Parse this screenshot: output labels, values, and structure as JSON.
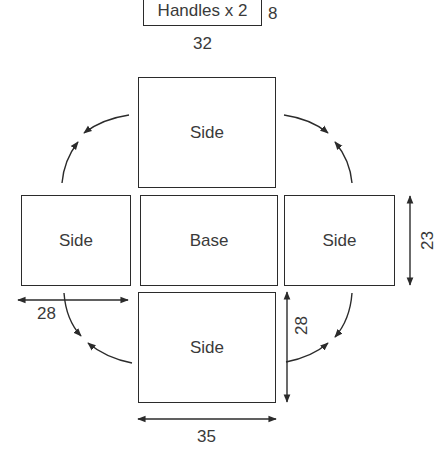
{
  "diagram": {
    "type": "box-net-template",
    "handles": {
      "label": "Handles x 2",
      "height_label": "8",
      "width_label": "32"
    },
    "panels": {
      "top": {
        "label": "Side"
      },
      "left": {
        "label": "Side"
      },
      "center": {
        "label": "Base"
      },
      "right": {
        "label": "Side"
      },
      "bottom": {
        "label": "Side"
      }
    },
    "dimensions": {
      "left_width": "28",
      "bottom_height": "28",
      "right_height": "23",
      "bottom_width": "35"
    },
    "colors": {
      "stroke": "#2b2b2b",
      "text": "#3a3a3a",
      "background": "#ffffff"
    }
  }
}
